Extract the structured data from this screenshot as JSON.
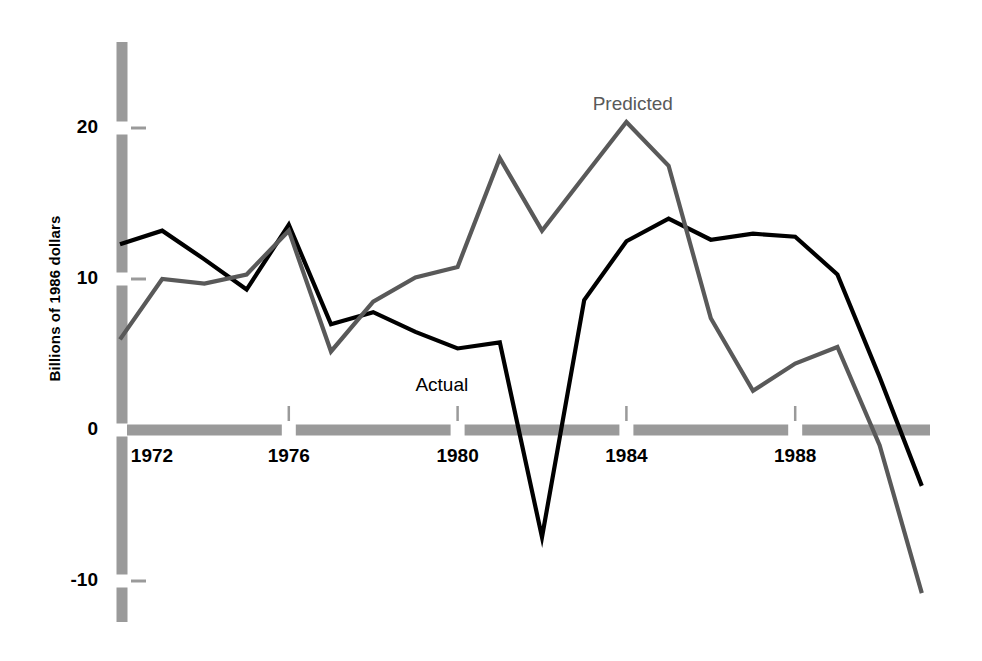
{
  "chart_data": {
    "type": "line",
    "title": "",
    "subtitle": "",
    "xlabel": "",
    "ylabel": "Billions of 1986 dollars",
    "x": [
      1972,
      1973,
      1974,
      1975,
      1976,
      1977,
      1978,
      1979,
      1980,
      1981,
      1982,
      1983,
      1984,
      1985,
      1986,
      1987,
      1988,
      1989,
      1990,
      1991
    ],
    "xlim": [
      1971.6,
      1991.2
    ],
    "ylim": [
      -12.5,
      25.5
    ],
    "xticks": [
      1972,
      1976,
      1980,
      1984,
      1988
    ],
    "xtick_labels": [
      "1972",
      "1976",
      "1980",
      "1984",
      "1988"
    ],
    "yticks": [
      20,
      10,
      0,
      -10
    ],
    "ytick_labels": [
      "20",
      "10",
      "0",
      "-10"
    ],
    "grid": false,
    "legend_position": "inline-annotation",
    "series": [
      {
        "name": "Actual",
        "color": "#000000",
        "label_x": 1979.0,
        "label_y": 3.0,
        "values": [
          12.3,
          13.2,
          11.3,
          9.3,
          13.6,
          7.0,
          7.8,
          6.5,
          5.4,
          5.8,
          -7.1,
          8.6,
          12.5,
          14.0,
          12.6,
          13.0,
          12.8,
          10.3,
          3.5,
          -3.7
        ]
      },
      {
        "name": "Predicted",
        "color": "#595959",
        "label_x": 1983.2,
        "label_y": 21.6,
        "values": [
          6.0,
          10.0,
          9.7,
          10.3,
          13.2,
          5.2,
          8.5,
          10.1,
          10.8,
          18.0,
          13.2,
          16.8,
          20.4,
          17.5,
          7.4,
          2.6,
          4.4,
          5.5,
          -1.0,
          -10.8
        ]
      }
    ]
  },
  "style": {
    "axis_bar_color": "#9a9a9a",
    "background": "#ffffff",
    "actual_color": "#000000",
    "predicted_color": "#595959"
  }
}
